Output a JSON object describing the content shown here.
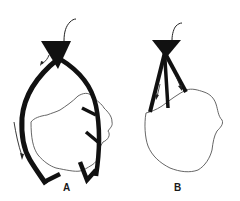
{
  "figure": {
    "panels": [
      {
        "id": "A",
        "label": "A",
        "description": "Inverted triangular cone device with a thin lead at top, two long thick curved arms wrapping around an organ outline, with barb-like hooks on the right arm and small arrows indicating direction along the left arm"
      },
      {
        "id": "B",
        "label": "B",
        "description": "Inverted triangular cone device with a thin lead at top, two short crossing straight arms converging above a rounded organ outline, with small arrows along the arms"
      }
    ],
    "colors": {
      "stroke": "#111111",
      "outline": "#555555",
      "background": "#ffffff"
    }
  }
}
